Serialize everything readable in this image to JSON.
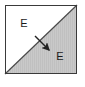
{
  "figure": {
    "type": "geometric-diagram",
    "canvas": {
      "width": 85,
      "height": 87,
      "background": "#ffffff"
    },
    "box": {
      "x": 5,
      "y": 5,
      "width": 72,
      "height": 69,
      "border_color": "#3a3a3a",
      "border_width": 1
    },
    "diagonal": {
      "from": [
        5,
        74
      ],
      "to": [
        77,
        5
      ],
      "color": "#4a4a4a",
      "width": 1.2
    },
    "regions": [
      {
        "id": "upper-left",
        "label": "E",
        "label_x": 24,
        "label_y": 24,
        "fill": "#ffffff",
        "hatched": false
      },
      {
        "id": "lower-right",
        "label": "E",
        "label_x": 60,
        "label_y": 57,
        "fill": "#c9c9c9",
        "hatched": true,
        "hatch_color": "#bdbdbd",
        "hatch_orientation": "vertical"
      }
    ],
    "arrow": {
      "from": [
        35,
        36
      ],
      "to": [
        51,
        52
      ],
      "color": "#222222",
      "width": 1.4,
      "head_length": 7,
      "head_width": 5,
      "direction": "down-right"
    }
  }
}
